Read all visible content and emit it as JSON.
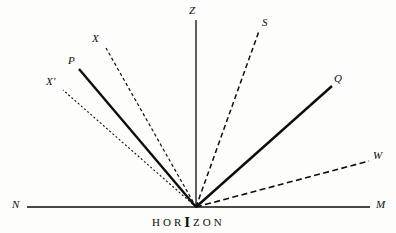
{
  "figure": {
    "background_color": "#fdfdfc",
    "ink_color": "#0d0d0d",
    "width": 396,
    "height": 233,
    "origin": {
      "x": 196,
      "y": 207
    }
  },
  "horizon": {
    "caption_letters": [
      "H",
      "O",
      "R",
      "I",
      "Z",
      "O",
      "N"
    ],
    "caption_text": "HORIZON",
    "emphasis_index": 3,
    "line": {
      "x1": 27,
      "y1": 207,
      "x2": 370,
      "y2": 207
    },
    "left_label": "N",
    "right_label": "M",
    "left_label_pos": {
      "x": 12,
      "y": 199
    },
    "right_label_pos": {
      "x": 376,
      "y": 199
    },
    "caption_pos": {
      "x": 152,
      "y": 214
    }
  },
  "rays": [
    {
      "id": "ray-x-prime",
      "label": "X'",
      "style": "dotted",
      "stroke_width": 1.1,
      "dash": "2,2.2",
      "x1": 196,
      "y1": 207,
      "x2": 63,
      "y2": 90,
      "label_pos": {
        "x": 46,
        "y": 76
      }
    },
    {
      "id": "ray-p",
      "label": "P",
      "style": "solid-thick",
      "stroke_width": 2.4,
      "dash": "none",
      "x1": 196,
      "y1": 207,
      "x2": 79,
      "y2": 69,
      "label_pos": {
        "x": 68,
        "y": 55
      }
    },
    {
      "id": "ray-x",
      "label": "X",
      "style": "dashed",
      "stroke_width": 1.2,
      "dash": "3.2,2.6",
      "x1": 196,
      "y1": 207,
      "x2": 106,
      "y2": 48,
      "label_pos": {
        "x": 92,
        "y": 33
      }
    },
    {
      "id": "ray-z",
      "label": "Z",
      "style": "solid-thin",
      "stroke_width": 1.3,
      "dash": "none",
      "x1": 196,
      "y1": 207,
      "x2": 196,
      "y2": 20,
      "label_pos": {
        "x": 189,
        "y": 5
      }
    },
    {
      "id": "ray-s",
      "label": "S",
      "style": "dashed",
      "stroke_width": 1.5,
      "dash": "5,3.2",
      "x1": 196,
      "y1": 207,
      "x2": 259,
      "y2": 31,
      "label_pos": {
        "x": 262,
        "y": 17
      }
    },
    {
      "id": "ray-q",
      "label": "Q",
      "style": "solid-thick",
      "stroke_width": 2.4,
      "dash": "none",
      "x1": 196,
      "y1": 207,
      "x2": 332,
      "y2": 86,
      "label_pos": {
        "x": 334,
        "y": 73
      }
    },
    {
      "id": "ray-w",
      "label": "W",
      "style": "dashed",
      "stroke_width": 1.6,
      "dash": "6,3.4",
      "x1": 196,
      "y1": 207,
      "x2": 369,
      "y2": 161,
      "label_pos": {
        "x": 373,
        "y": 150
      }
    }
  ]
}
